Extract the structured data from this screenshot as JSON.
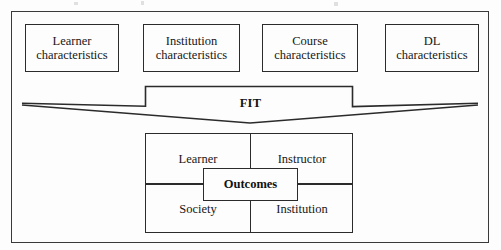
{
  "diagram": {
    "title_label": "FIT",
    "inputs": [
      {
        "line1": "Learner",
        "line2": "characteristics"
      },
      {
        "line1": "Institution",
        "line2": "characteristics"
      },
      {
        "line1": "Course",
        "line2": "characteristics"
      },
      {
        "line1": "DL",
        "line2": "characteristics"
      }
    ],
    "outcomes": {
      "center_label": "Outcomes",
      "quadrants": {
        "top_left": "Learner",
        "top_right": "Instructor",
        "bottom_left": "Society",
        "bottom_right": "Institution"
      }
    },
    "colors": {
      "line": "#2b2b2b",
      "frame": "#3a3a3a",
      "text": "#171717",
      "background": "#fdfdfd"
    }
  }
}
